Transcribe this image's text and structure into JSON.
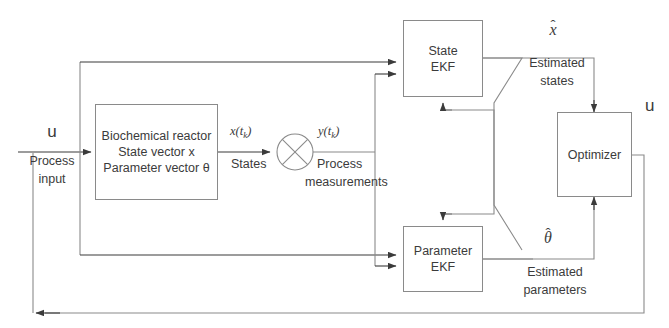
{
  "diagram": {
    "stroke_color": "#8a8a8a",
    "text_color": "#3b3b3b",
    "background": "#ffffff"
  },
  "blocks": {
    "reactor": {
      "line1": "Biochemical reactor",
      "line2": "State vector x",
      "line3": "Parameter vector θ"
    },
    "state_ekf": {
      "line1": "State",
      "line2": "EKF"
    },
    "parameter_ekf": {
      "line1": "Parameter",
      "line2": "EKF"
    },
    "optimizer": {
      "line1": "Optimizer"
    }
  },
  "signals": {
    "input_u": "u",
    "input_u_caption_line1": "Process",
    "input_u_caption_line2": "input",
    "states_symbol_var": "x",
    "states_symbol_arg": "(t",
    "states_symbol_sub": "k",
    "states_symbol_close": ")",
    "states_caption": "States",
    "measurements_symbol_var": "y",
    "measurements_symbol_arg": "(t",
    "measurements_symbol_sub": "k",
    "measurements_symbol_close": ")",
    "measurements_caption_line1": "Process",
    "measurements_caption_line2": "measurements",
    "estimated_states_symbol": "x",
    "estimated_states_hat": "̂",
    "estimated_states_caption_line1": "Estimated",
    "estimated_states_caption_line2": "states",
    "estimated_parameters_symbol": "θ",
    "estimated_parameters_hat": "̂",
    "estimated_parameters_caption_line1": "Estimated",
    "estimated_parameters_caption_line2": "parameters",
    "optimizer_output_u": "u"
  },
  "nodes": {
    "mixer": "circle-with-cross"
  }
}
